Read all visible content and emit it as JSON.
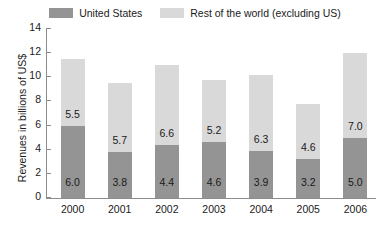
{
  "legend": {
    "entries": [
      {
        "label": "United States",
        "color": "#949494",
        "key": "us"
      },
      {
        "label": "Rest of the world (excluding US)",
        "color": "#d9d9d9",
        "key": "row"
      }
    ]
  },
  "axes": {
    "ylabel": "Revenues in billions of US$",
    "xlabel": "",
    "yticks": [
      "0",
      "2",
      "4",
      "6",
      "8",
      "10",
      "12",
      "14"
    ]
  },
  "chart_data": {
    "type": "bar",
    "title": "",
    "subtitle": "",
    "xlabel": "",
    "ylabel": "Revenues in billions of US$",
    "ylim": [
      0,
      14
    ],
    "ytick_values": [
      0,
      2,
      4,
      6,
      8,
      10,
      12,
      14
    ],
    "grid": false,
    "stacked": true,
    "legend_position": "top-center",
    "categories": [
      "2000",
      "2001",
      "2002",
      "2003",
      "2004",
      "2005",
      "2006"
    ],
    "series": [
      {
        "name": "United States",
        "color": "#949494",
        "values": [
          6.0,
          3.8,
          4.4,
          4.6,
          3.9,
          3.2,
          5.0
        ],
        "labels": [
          "6.0",
          "3.8",
          "4.4",
          "4.6",
          "3.9",
          "3.2",
          "5.0"
        ]
      },
      {
        "name": "Rest of the world (excluding US)",
        "color": "#d9d9d9",
        "values": [
          5.5,
          5.7,
          6.6,
          5.2,
          6.3,
          4.6,
          7.0
        ],
        "labels": [
          "5.5",
          "5.7",
          "6.6",
          "5.2",
          "6.3",
          "4.6",
          "7.0"
        ]
      }
    ],
    "totals": [
      11.5,
      9.5,
      11.0,
      9.8,
      10.2,
      7.8,
      12.0
    ]
  }
}
